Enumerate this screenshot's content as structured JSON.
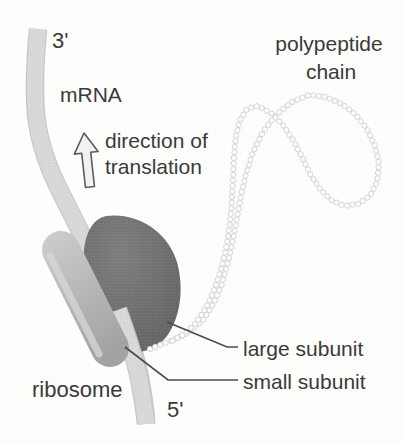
{
  "labels": {
    "three_prime": "3'",
    "mrna": "mRNA",
    "direction_line1": "direction of",
    "direction_line2": "translation",
    "polypeptide_line1": "polypeptide",
    "polypeptide_line2": "chain",
    "ribosome": "ribosome",
    "five_prime": "5'",
    "large_subunit": "large subunit",
    "small_subunit": "small subunit"
  },
  "colors": {
    "background": "#fdfdfc",
    "text": "#3a3a3a",
    "mrna_ribbon": "#d9dbda",
    "mrna_ribbon_edge": "#c6c8c7",
    "large_subunit": "#6e706f",
    "small_subunit": "#b7b9b8",
    "bead_stroke": "#d2d4d4",
    "bead_fill": "#fefefe",
    "leader_line": "#4b4b4b",
    "arrow_outline": "#5c5c5c",
    "arrow_fill": "#f2f3f1"
  },
  "polypeptide_chain": {
    "bead_radius": 2.6,
    "bead_spacing": 5.6,
    "points": [
      [
        150,
        349
      ],
      [
        170,
        341
      ],
      [
        188,
        333
      ],
      [
        203,
        320
      ],
      [
        214,
        303
      ],
      [
        222,
        284
      ],
      [
        228,
        262
      ],
      [
        233,
        240
      ],
      [
        237,
        218
      ],
      [
        241,
        196
      ],
      [
        246,
        174
      ],
      [
        253,
        152
      ],
      [
        263,
        132
      ],
      [
        276,
        115
      ],
      [
        292,
        102
      ],
      [
        309,
        95
      ],
      [
        326,
        97
      ],
      [
        342,
        104
      ],
      [
        356,
        115
      ],
      [
        367,
        129
      ],
      [
        375,
        146
      ],
      [
        379,
        164
      ],
      [
        377,
        182
      ],
      [
        370,
        196
      ],
      [
        358,
        204
      ],
      [
        344,
        206
      ],
      [
        331,
        200
      ],
      [
        320,
        189
      ],
      [
        310,
        174
      ],
      [
        302,
        157
      ],
      [
        293,
        140
      ],
      [
        283,
        125
      ],
      [
        271,
        113
      ],
      [
        258,
        106
      ],
      [
        247,
        109
      ],
      [
        240,
        120
      ],
      [
        236,
        136
      ],
      [
        234,
        156
      ],
      [
        233,
        178
      ],
      [
        232,
        200
      ],
      [
        230,
        222
      ],
      [
        227,
        244
      ],
      [
        222,
        266
      ],
      [
        215,
        288
      ],
      [
        206,
        308
      ],
      [
        195,
        324
      ],
      [
        183,
        335
      ],
      [
        172,
        341
      ]
    ]
  }
}
